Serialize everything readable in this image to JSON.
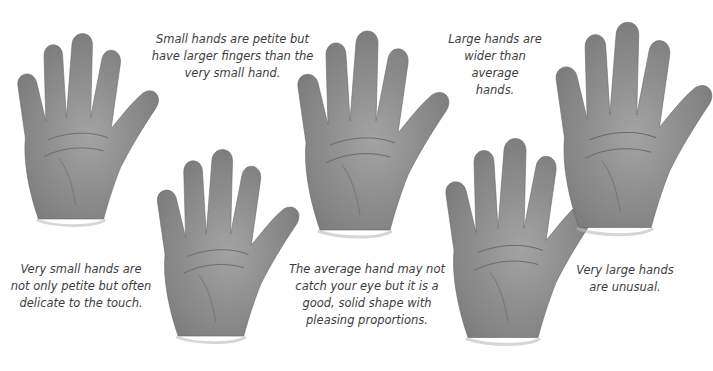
{
  "figure": {
    "hands": [
      {
        "id": "very-small",
        "caption": [
          "Very small hands are",
          "not only petite but often",
          "delicate to the touch."
        ]
      },
      {
        "id": "small",
        "caption": [
          "Small hands are petite but",
          "have larger fingers than the",
          "very small hand."
        ]
      },
      {
        "id": "average",
        "caption": [
          "The average hand may not",
          "catch your eye but it is a",
          "good, solid shape with",
          "pleasing proportions."
        ]
      },
      {
        "id": "large",
        "caption": [
          "Large hands are",
          "wider than average",
          "hands."
        ]
      },
      {
        "id": "very-large",
        "caption": [
          "Very large hands",
          "are unusual."
        ]
      }
    ]
  }
}
